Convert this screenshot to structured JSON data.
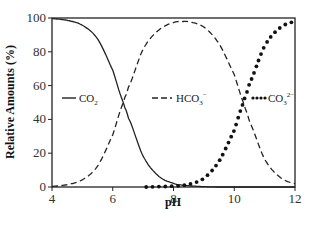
{
  "chart_data": {
    "type": "line",
    "title": "",
    "xlabel": "pH",
    "ylabel": "Relative Amounts (%)",
    "xlim": [
      4,
      12
    ],
    "ylim": [
      0,
      100
    ],
    "x_ticks": [
      "4",
      "6",
      "8",
      "10",
      "12"
    ],
    "y_ticks": [
      "0",
      "20",
      "40",
      "60",
      "80",
      "100"
    ],
    "grid": false,
    "legend_position": "inside, middle row at y≈50",
    "x": [
      4.0,
      4.5,
      5.0,
      5.5,
      6.0,
      6.35,
      6.5,
      7.0,
      7.5,
      8.0,
      8.3,
      8.5,
      9.0,
      9.5,
      10.0,
      10.3,
      10.5,
      11.0,
      11.5,
      12.0
    ],
    "series": [
      {
        "name": "CO2",
        "label_base": "CO",
        "label_sub": "2",
        "label_sup": "",
        "style": "solid",
        "values": [
          99.6,
          98.6,
          95.7,
          87.6,
          69.1,
          50.0,
          41.4,
          18.3,
          6.6,
          2.2,
          1.1,
          0.7,
          0.2,
          0.0,
          0.0,
          0.0,
          0.0,
          0.0,
          0.0,
          0.0
        ]
      },
      {
        "name": "HCO3-",
        "label_base": "HCO",
        "label_sub": "3",
        "label_sup": "−",
        "style": "dashed",
        "values": [
          0.4,
          1.4,
          4.3,
          12.4,
          30.9,
          50.0,
          58.5,
          81.5,
          92.6,
          97.3,
          97.9,
          97.7,
          94.6,
          84.7,
          66.6,
          50.0,
          38.7,
          16.6,
          5.9,
          2.0
        ]
      },
      {
        "name": "CO3 2-",
        "label_base": "CO",
        "label_sub": "3",
        "label_sup": "2−",
        "style": "dotted",
        "values": [
          0.0,
          0.0,
          0.0,
          0.0,
          0.0,
          0.0,
          0.0,
          0.0,
          0.2,
          0.5,
          1.0,
          1.6,
          5.2,
          15.3,
          33.4,
          50.0,
          61.3,
          83.4,
          94.1,
          98.0
        ]
      }
    ]
  },
  "legend": {
    "co2": {
      "base": "CO",
      "sub": "2",
      "sup": ""
    },
    "hco3": {
      "base": "HCO",
      "sub": "3",
      "sup": "−"
    },
    "co3": {
      "base": "CO",
      "sub": "3",
      "sup": "2−"
    }
  },
  "axes": {
    "xlabel": "pH",
    "ylabel": "Relative Amounts (%)"
  }
}
